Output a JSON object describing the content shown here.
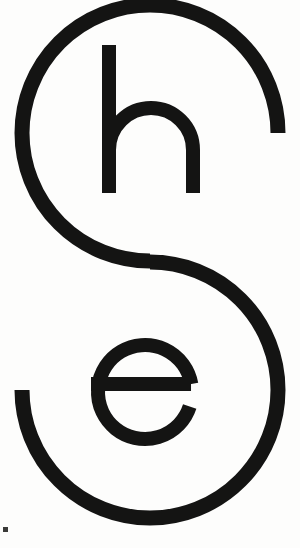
{
  "artwork": {
    "kind": "typographic-logo",
    "wordmark": "she",
    "description": "Lowercase wordmark 'she' where the S is drawn as a large open double-arc spine, with the h nested in the upper counter and the e nested in the lower counter",
    "background_color": "#fdfdfc",
    "ink_color": "#141413",
    "canvas": {
      "width": 300,
      "height": 548
    },
    "letters": [
      {
        "glyph": "S",
        "name": "letter-s-spine",
        "role": "outer-spine",
        "stroke_width": 15,
        "upper_arc": {
          "cx": 150,
          "cy": 133,
          "r": 128,
          "opening": "right",
          "terminus_y": 133
        },
        "lower_arc": {
          "cx": 150,
          "cy": 390,
          "r": 128,
          "opening": "left",
          "terminus_y": 383
        },
        "top_y": 5,
        "bottom_y": 518
      },
      {
        "glyph": "h",
        "name": "letter-h",
        "role": "upper-counter",
        "stroke_width": 14,
        "ascender_top_y": 45,
        "baseline_y": 193,
        "left_stem_x": 102,
        "right_stem_x": 186,
        "shoulder_y": 108
      },
      {
        "glyph": "e",
        "name": "letter-e",
        "role": "lower-counter",
        "stroke_width": 14,
        "center": {
          "x": 145,
          "y": 392
        },
        "outer_radius": 54,
        "crossbar_y": 384,
        "aperture": "lower-right"
      }
    ],
    "artifacts": [
      {
        "name": "scan-speck",
        "x": 3,
        "y": 527,
        "width": 5,
        "height": 5
      }
    ]
  }
}
